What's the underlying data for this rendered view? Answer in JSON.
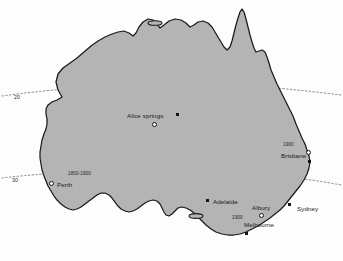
{
  "map": {
    "title": "Australia",
    "fill_color": "#b4b4b4",
    "outline_color": "#1a1a1a",
    "background_color": "#fdfdfd",
    "graticule_color": "#6f6f72",
    "graticule_style": "dotted"
  },
  "latitude_labels": [
    {
      "text": "20",
      "x": 14,
      "y": 95
    },
    {
      "text": "30",
      "x": 12,
      "y": 178
    }
  ],
  "cities": [
    {
      "name": "Alice springs",
      "label_x": 127,
      "label_y": 113,
      "marker_type": "square",
      "marker_x": 176,
      "marker_y": 113,
      "ring_type": "circle",
      "ring_x": 152,
      "ring_y": 122
    },
    {
      "name": "Brisbane",
      "label_x": 281,
      "label_y": 153,
      "marker_type": "square",
      "marker_x": 308,
      "marker_y": 160,
      "ring_type": "circle",
      "ring_x": 306,
      "ring_y": 150
    },
    {
      "name": "Perth",
      "label_x": 57,
      "label_y": 182,
      "marker_type": "circle",
      "marker_x": 49,
      "marker_y": 181
    },
    {
      "name": "Adelaide",
      "label_x": 213,
      "label_y": 199,
      "marker_type": "square",
      "marker_x": 206,
      "marker_y": 199
    },
    {
      "name": "Albury",
      "label_x": 252,
      "label_y": 205,
      "ring_type": "circle",
      "ring_x": 259,
      "ring_y": 213
    },
    {
      "name": "Melbourne",
      "label_x": 244,
      "label_y": 222,
      "marker_type": "square",
      "marker_x": 245,
      "marker_y": 232
    },
    {
      "name": "Sydney",
      "label_x": 297,
      "label_y": 206,
      "marker_type": "square",
      "marker_x": 288,
      "marker_y": 203
    }
  ],
  "year_annotations": [
    {
      "text": "1800-1900",
      "x": 68,
      "y": 172
    },
    {
      "text": "1900",
      "x": 283,
      "y": 143
    },
    {
      "text": "1900",
      "x": 232,
      "y": 216
    }
  ],
  "legend": {
    "square_meaning": "city marker",
    "circle_meaning": "spread location"
  }
}
